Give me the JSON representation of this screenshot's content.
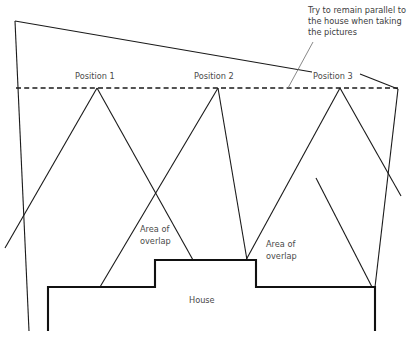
{
  "diagram": {
    "title_note": {
      "lines": [
        "Try to remain parallel to",
        "the house when taking",
        "the pictures"
      ],
      "line1": "Try to remain parallel to",
      "line2": "the house when taking",
      "line3": "the pictures"
    },
    "positions": [
      {
        "label": "Position 1"
      },
      {
        "label": "Position 2"
      },
      {
        "label": "Position 3"
      }
    ],
    "overlap_labels": [
      {
        "line1": "Area of",
        "line2": "overlap"
      },
      {
        "line1": "Area of",
        "line2": "overlap"
      }
    ],
    "house_label": "House",
    "colors": {
      "line": "#1a1a1a",
      "house_line": "#111111",
      "text": "#4a4a4a",
      "background": "#ffffff"
    }
  }
}
